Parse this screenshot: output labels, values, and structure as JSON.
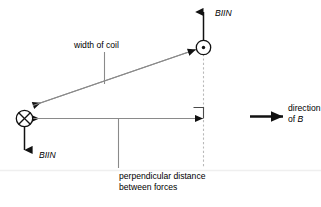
{
  "diagram": {
    "background_color": "#ffffff",
    "line_color": "#808080",
    "dark_line_color": "#1a1a1a",
    "dashed_color": "#b0b0b0",
    "text_color": "#000000",
    "width": 321,
    "height": 207
  },
  "labels": {
    "force_top": "BIIN",
    "force_bottom": "BIIN",
    "width_of_coil": "width of coil",
    "direction_of_b_line1": "direction",
    "direction_of_b_line2_prefix": "of ",
    "direction_of_b_line2_symbol": "B",
    "perp_distance_line1": "perpendicular distance",
    "perp_distance_line2": "between forces"
  },
  "symbols": {
    "current_into_page": "circle-cross",
    "current_out_of_page": "circle-dot",
    "right_angle_marker": "right-angle-square"
  },
  "arrows": {
    "force_up": "arrow-up",
    "force_down": "arrow-down",
    "coil_width_left": "arrow-left",
    "separation_left": "arrow-left",
    "separation_right": "arrow-right",
    "field_direction": "arrow-right-thick"
  }
}
